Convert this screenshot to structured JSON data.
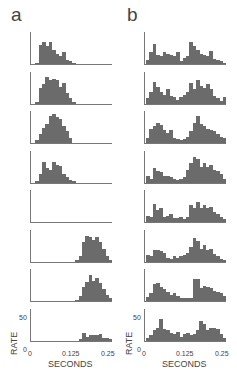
{
  "figure": {
    "panel_labels": [
      "a",
      "b"
    ],
    "xlabel": "SECONDS",
    "ylabel": "RATE",
    "xticks": [
      "0",
      "0.125",
      "0.25"
    ],
    "yticks": [
      "0",
      "50"
    ]
  },
  "chart_data": {
    "type": "bar",
    "title": "",
    "xlabel": "SECONDS",
    "ylabel": "RATE",
    "xlim": [
      0,
      0.25
    ],
    "ylim": [
      0,
      50
    ],
    "bin_width": 0.0104,
    "n_bins": 24,
    "columns": [
      {
        "label": "a",
        "rows": [
          {
            "values": [
              0,
              2,
              30,
              34,
              28,
              34,
              22,
              16,
              12,
              18,
              6,
              4,
              2,
              0,
              0,
              0,
              0,
              0,
              0,
              0,
              0,
              0,
              0,
              0
            ]
          },
          {
            "values": [
              0,
              2,
              24,
              30,
              42,
              36,
              38,
              36,
              26,
              32,
              16,
              8,
              2,
              0,
              0,
              0,
              0,
              0,
              0,
              0,
              0,
              0,
              0,
              0
            ]
          },
          {
            "values": [
              0,
              4,
              14,
              24,
              30,
              42,
              46,
              40,
              38,
              26,
              18,
              8,
              0,
              0,
              0,
              0,
              0,
              0,
              0,
              0,
              0,
              0,
              0,
              0
            ]
          },
          {
            "values": [
              0,
              2,
              14,
              32,
              22,
              20,
              32,
              28,
              26,
              14,
              8,
              4,
              2,
              0,
              0,
              0,
              0,
              0,
              0,
              0,
              0,
              0,
              0,
              0
            ]
          },
          {
            "values": [
              0,
              0,
              0,
              0,
              0,
              0,
              0,
              0,
              0,
              0,
              0,
              0,
              0,
              0,
              0,
              0,
              0,
              0,
              0,
              0,
              0,
              0,
              0,
              0
            ]
          },
          {
            "values": [
              0,
              0,
              0,
              0,
              0,
              0,
              0,
              0,
              0,
              0,
              0,
              0,
              0,
              2,
              8,
              30,
              40,
              38,
              34,
              38,
              30,
              20,
              8,
              2
            ]
          },
          {
            "values": [
              0,
              0,
              0,
              0,
              0,
              0,
              0,
              0,
              0,
              0,
              0,
              0,
              0,
              2,
              8,
              22,
              30,
              40,
              32,
              36,
              28,
              18,
              10,
              4
            ]
          },
          {
            "values": [
              0,
              0,
              0,
              0,
              0,
              0,
              0,
              0,
              0,
              0,
              0,
              0,
              0,
              0,
              2,
              12,
              6,
              8,
              8,
              8,
              10,
              4,
              4,
              2
            ]
          }
        ]
      },
      {
        "label": "b",
        "rows": [
          {
            "values": [
              6,
              18,
              32,
              14,
              12,
              18,
              16,
              14,
              12,
              18,
              4,
              10,
              12,
              34,
              28,
              22,
              16,
              14,
              12,
              20,
              8,
              6,
              4,
              2
            ]
          },
          {
            "values": [
              8,
              18,
              34,
              26,
              18,
              14,
              22,
              12,
              10,
              6,
              10,
              14,
              18,
              32,
              22,
              36,
              28,
              24,
              30,
              22,
              12,
              8,
              4,
              10
            ]
          },
          {
            "values": [
              8,
              22,
              26,
              32,
              28,
              20,
              16,
              20,
              8,
              6,
              4,
              6,
              10,
              18,
              32,
              42,
              30,
              26,
              22,
              20,
              18,
              14,
              10,
              8
            ]
          },
          {
            "values": [
              10,
              6,
              22,
              18,
              16,
              10,
              10,
              8,
              6,
              4,
              6,
              8,
              20,
              30,
              40,
              36,
              24,
              30,
              24,
              28,
              20,
              18,
              14,
              6
            ]
          },
          {
            "values": [
              10,
              8,
              28,
              18,
              22,
              8,
              10,
              12,
              6,
              6,
              8,
              4,
              8,
              26,
              22,
              32,
              22,
              26,
              22,
              24,
              16,
              12,
              8,
              4
            ]
          },
          {
            "values": [
              10,
              8,
              18,
              18,
              16,
              14,
              6,
              4,
              8,
              6,
              8,
              10,
              14,
              22,
              36,
              32,
              20,
              26,
              18,
              20,
              12,
              8,
              4,
              2
            ]
          },
          {
            "values": [
              6,
              12,
              26,
              28,
              22,
              18,
              14,
              10,
              12,
              8,
              4,
              4,
              4,
              4,
              34,
              34,
              20,
              24,
              22,
              20,
              16,
              14,
              12,
              8
            ]
          },
          {
            "values": [
              4,
              8,
              16,
              20,
              34,
              18,
              16,
              12,
              10,
              14,
              6,
              10,
              12,
              8,
              10,
              16,
              30,
              26,
              16,
              20,
              20,
              18,
              10,
              4
            ]
          }
        ]
      }
    ],
    "legend": [],
    "grid": false
  }
}
